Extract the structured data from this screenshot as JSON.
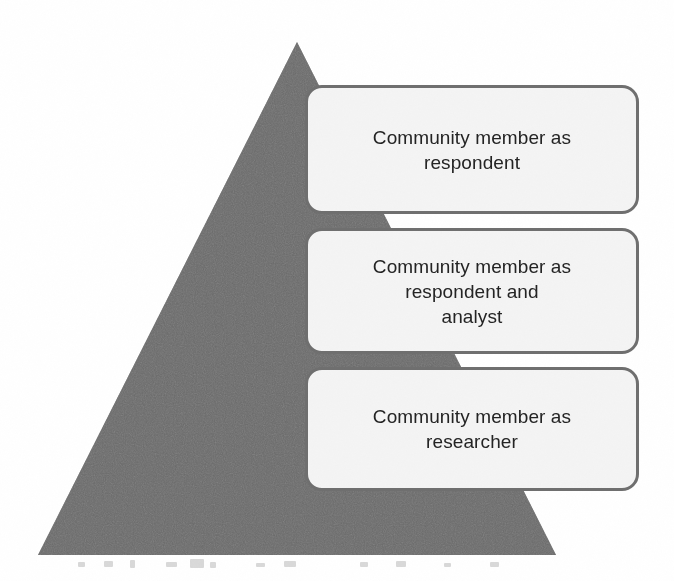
{
  "figure": {
    "name": "participation-pyramid",
    "shape": "triangle",
    "orientation": "apex-up",
    "colors": {
      "triangle_fill": "#6b6b6b",
      "box_fill": "#f4f4f4",
      "box_border": "#6f6f6f",
      "text": "#242424",
      "background": "#ffffff"
    },
    "geometry": {
      "apex": [
        297,
        42
      ],
      "base_left": [
        38,
        555
      ],
      "base_right": [
        556,
        555
      ]
    }
  },
  "stages": [
    {
      "id": "stage-respondent",
      "order": 1,
      "label": "Community member as\nrespondent",
      "lines": [
        "Community member as",
        "respondent"
      ]
    },
    {
      "id": "stage-respondent-analyst",
      "order": 2,
      "label": "Community member as\nrespondent and\nanalyst",
      "lines": [
        "Community member as",
        "respondent and",
        "analyst"
      ]
    },
    {
      "id": "stage-researcher",
      "order": 3,
      "label": "Community member as\nresearcher",
      "lines": [
        "Community member as",
        "researcher"
      ]
    }
  ]
}
